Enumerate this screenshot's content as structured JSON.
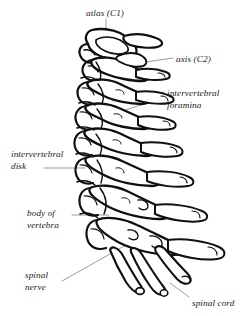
{
  "figure": {
    "view": "lateral",
    "background_color": "#ffffff",
    "ink_color": "#101010",
    "leader_color": "#8a8a8a",
    "style": "pen-and-ink line drawing"
  },
  "labels": {
    "atlas": {
      "text": "atlas (C1)",
      "lines": [
        "atlas (C1)"
      ],
      "x": 86,
      "y": 8,
      "align": "center"
    },
    "axis": {
      "text": "axis (C2)",
      "lines": [
        "axis (C2)"
      ],
      "x": 176,
      "y": 54,
      "align": "left"
    },
    "foramina": {
      "text": "intervertebral foramina",
      "lines": [
        "intervertebral",
        "foramina"
      ],
      "x": 167,
      "y": 88,
      "align": "left"
    },
    "disk": {
      "text": "intervertebral disk",
      "lines": [
        "intervertebral",
        "disk"
      ],
      "x": 11,
      "y": 149,
      "align": "left"
    },
    "body": {
      "text": "body of vertebra",
      "lines": [
        "body of",
        "vertebra"
      ],
      "x": 27,
      "y": 208,
      "align": "left"
    },
    "nerve": {
      "text": "spinal nerve",
      "lines": [
        "spinal",
        "nerve"
      ],
      "x": 25,
      "y": 270,
      "align": "left"
    },
    "cord": {
      "text": "spinal cord",
      "lines": [
        "spinal cord"
      ],
      "x": 192,
      "y": 298,
      "align": "left"
    }
  },
  "leaders": [
    {
      "name": "atlas-leader",
      "points": "106,19 106,50"
    },
    {
      "name": "axis-leader",
      "points": "173,58 139,63"
    },
    {
      "name": "foramina-leader-upper",
      "points": "164,92 112,101"
    },
    {
      "name": "foramina-leader-lower",
      "points": "164,97 105,117"
    },
    {
      "name": "disk-leader",
      "points": "44,168 85,168"
    },
    {
      "name": "body-leader",
      "points": "72,215 109,215"
    },
    {
      "name": "nerve-leader",
      "points": "62,281 126,245"
    },
    {
      "name": "cord-leader",
      "points": "189,297 170,283"
    }
  ]
}
